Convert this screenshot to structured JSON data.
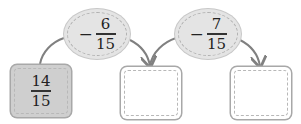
{
  "diagram": {
    "start": {
      "numerator": "14",
      "denominator": "15"
    },
    "operations": [
      {
        "sign": "−",
        "numerator": "6",
        "denominator": "15"
      },
      {
        "sign": "−",
        "numerator": "7",
        "denominator": "15"
      }
    ],
    "answer_boxes": [
      {
        "value": ""
      },
      {
        "value": ""
      }
    ],
    "colors": {
      "ellipse_fill": "#e4e4e4",
      "start_box_fill": "#cfcfcf",
      "arrow": "#808080"
    }
  }
}
